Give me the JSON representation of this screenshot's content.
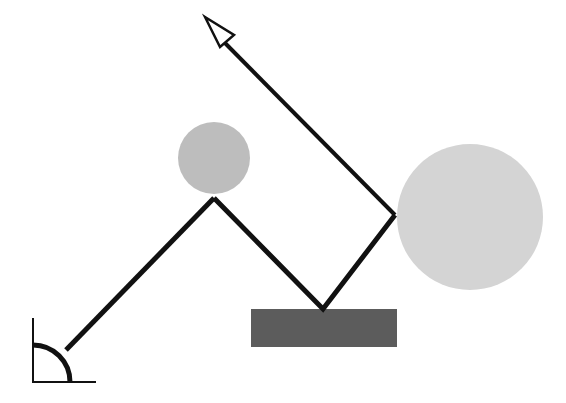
{
  "diagram": {
    "type": "mechanical-linkage",
    "colors": {
      "line": "#111111",
      "small_ball": "#bdbdbd",
      "large_ball": "#d4d4d4",
      "base_block": "#5c5c5c",
      "background": "#ffffff"
    },
    "angle_marker": {
      "vertex": [
        33,
        382
      ],
      "vertical_top": [
        33,
        318
      ],
      "horizontal_end": [
        96,
        382
      ],
      "arc_radius": 37
    },
    "links": [
      {
        "from": [
          66,
          350
        ],
        "to": [
          214,
          198
        ]
      },
      {
        "from": [
          214,
          198
        ],
        "to": [
          323,
          309
        ]
      },
      {
        "from": [
          323,
          309
        ],
        "to": [
          395,
          215
        ]
      }
    ],
    "arrow": {
      "from": [
        395,
        215
      ],
      "tip": [
        205,
        17
      ]
    },
    "small_ball": {
      "cx": 214,
      "cy": 158,
      "r": 36
    },
    "large_ball": {
      "cx": 470,
      "cy": 217,
      "r": 73
    },
    "base_block": {
      "x": 251,
      "y": 309,
      "w": 146,
      "h": 38
    }
  }
}
